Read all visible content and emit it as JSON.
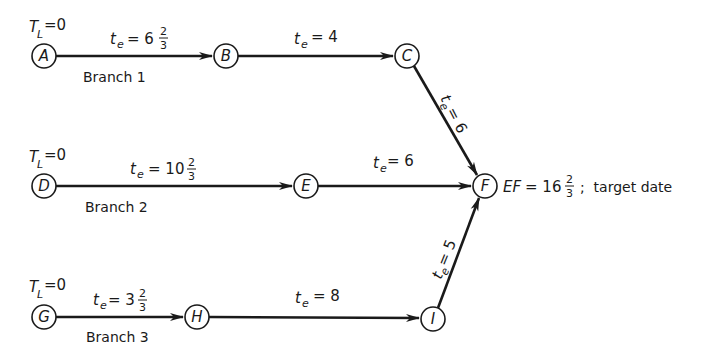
{
  "diagram": {
    "type": "PERT network",
    "colors": {
      "line": "#1a1a1a",
      "background": "#ffffff"
    },
    "nodes": [
      {
        "id": "A",
        "label": "A",
        "tl_label": "T",
        "tl_sub": "L",
        "tl_value": "=0"
      },
      {
        "id": "B",
        "label": "B"
      },
      {
        "id": "C",
        "label": "C"
      },
      {
        "id": "D",
        "label": "D",
        "tl_label": "T",
        "tl_sub": "L",
        "tl_value": "=0"
      },
      {
        "id": "E",
        "label": "E"
      },
      {
        "id": "F",
        "label": "F"
      },
      {
        "id": "G",
        "label": "G",
        "tl_label": "T",
        "tl_sub": "L",
        "tl_value": "=0"
      },
      {
        "id": "H",
        "label": "H"
      },
      {
        "id": "I",
        "label": "I"
      }
    ],
    "edges": [
      {
        "from": "A",
        "to": "B",
        "t": "t",
        "sub": "e",
        "eq": "= 6",
        "frac_num": "2",
        "frac_den": "3"
      },
      {
        "from": "B",
        "to": "C",
        "t": "t",
        "sub": "e",
        "eq": "= 4"
      },
      {
        "from": "C",
        "to": "F",
        "t": "t",
        "sub": "e",
        "eq": "= 6"
      },
      {
        "from": "D",
        "to": "E",
        "t": "t",
        "sub": "e",
        "eq": "= 10",
        "frac_num": "2",
        "frac_den": "3"
      },
      {
        "from": "E",
        "to": "F",
        "t": "t",
        "sub": "e",
        "eq": "= 6"
      },
      {
        "from": "G",
        "to": "H",
        "t": "t",
        "sub": "e",
        "eq": "= 3",
        "frac_num": "2",
        "frac_den": "3"
      },
      {
        "from": "H",
        "to": "I",
        "t": "t",
        "sub": "e",
        "eq": "= 8"
      },
      {
        "from": "I",
        "to": "F",
        "t": "t",
        "sub": "e",
        "eq": "= 5"
      }
    ],
    "branches": [
      "Branch 1",
      "Branch 2",
      "Branch 3"
    ],
    "finish": {
      "ef_label": "EF",
      "ef_eq": "= 16",
      "frac_num": "2",
      "frac_den": "3",
      "suffix": ";  target date"
    }
  }
}
